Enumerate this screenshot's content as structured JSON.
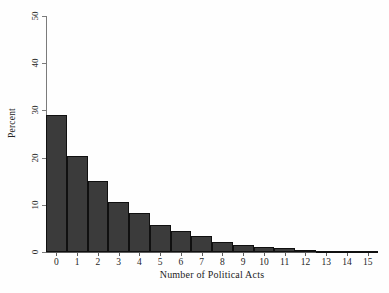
{
  "chart_data": {
    "type": "bar",
    "title": "",
    "subtitle": "",
    "xlabel": "Number of Political Acts",
    "ylabel": "Percent",
    "categories": [
      "0",
      "1",
      "2",
      "3",
      "4",
      "5",
      "6",
      "7",
      "8",
      "9",
      "10",
      "11",
      "12",
      "13",
      "14",
      "15"
    ],
    "values": [
      29.0,
      20.3,
      15.0,
      10.5,
      8.3,
      5.7,
      4.4,
      3.3,
      2.2,
      1.5,
      1.1,
      0.8,
      0.4,
      0.3,
      0.2,
      0.2
    ],
    "xlim": [
      -0.5,
      15.5
    ],
    "ylim": [
      0,
      50
    ],
    "ytick_values": [
      0,
      10,
      20,
      30,
      40,
      50
    ],
    "ytick_labels": [
      "0",
      "10",
      "20",
      "30",
      "40",
      "50"
    ],
    "xtick_labels": [
      "0",
      "1",
      "2",
      "3",
      "4",
      "5",
      "6",
      "7",
      "8",
      "9",
      "10",
      "11",
      "12",
      "13",
      "14",
      "15"
    ],
    "grid": false,
    "legend": false,
    "legend_position": "none",
    "bar_color": "#3b3b3b",
    "bar_edge_color": "#101010",
    "axis_color": "#5c5c5c",
    "background_color": "#fefefe"
  }
}
